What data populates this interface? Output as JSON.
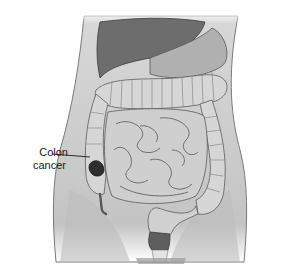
{
  "figure": {
    "annotation": {
      "line1": "Colon",
      "line2": "cancer",
      "target": "ascending colon tumor"
    },
    "colors": {
      "background": "#ffffff",
      "body": "#c9c9c9",
      "body_edge": "#7a7a7a",
      "liver": "#6d6d6d",
      "stomach": "#b0b0b0",
      "intestine": "#d6d6d6",
      "intestine_edge": "#5a5a5a",
      "tumor": "#2e2e2e"
    }
  }
}
